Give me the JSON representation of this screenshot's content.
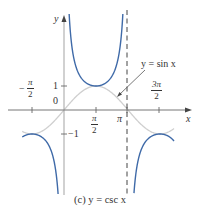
{
  "chart_data": {
    "type": "line",
    "title": "(c) y = csc x",
    "xlabel": "x",
    "ylabel": "y",
    "x_ticks": [
      {
        "value": -1.5708,
        "label": "-π/2"
      },
      {
        "value": 1.5708,
        "label": "π/2"
      },
      {
        "value": 3.1416,
        "label": "π"
      },
      {
        "value": 4.7124,
        "label": "3π/2"
      }
    ],
    "y_ticks": [
      {
        "value": 1,
        "label": "1"
      },
      {
        "value": 0,
        "label": "0"
      },
      {
        "value": -1,
        "label": "-1"
      }
    ],
    "xlim": [
      -2.0,
      5.9
    ],
    "ylim": [
      -3.6,
      4.2
    ],
    "grid": false,
    "series": [
      {
        "name": "y = csc x",
        "color": "#3f6aa8",
        "style": "solid",
        "domain": "x in (-2.0,0) ∪ (0,π) ∪ (π,5.4)",
        "key_points": [
          [
            -1.5708,
            -1
          ],
          [
            1.5708,
            1
          ],
          [
            4.7124,
            -1
          ]
        ]
      },
      {
        "name": "y = sin x",
        "color": "#c8c8c8",
        "style": "solid",
        "key_points": [
          [
            -1.5708,
            -1
          ],
          [
            0,
            0
          ],
          [
            1.5708,
            1
          ],
          [
            3.1416,
            0
          ],
          [
            4.7124,
            -1
          ]
        ]
      }
    ],
    "asymptotes": [
      {
        "x": 3.1416,
        "style": "dashed"
      }
    ],
    "annotations": [
      {
        "text": "y = sin x",
        "arrow_to": [
          2.6,
          0.5
        ]
      }
    ]
  },
  "labels": {
    "y_axis": "y",
    "x_axis": "x",
    "neg_pi_half": {
      "sign": "−",
      "num": "π",
      "den": "2"
    },
    "pi_half": {
      "num": "π",
      "den": "2"
    },
    "pi": "π",
    "three_pi_half": {
      "num": "3π",
      "den": "2"
    },
    "one": "1",
    "zero": "0",
    "neg_one": "−1",
    "sin_annotation": "y = sin x",
    "caption": "(c) y = csc x"
  },
  "colors": {
    "csc": "#3f6aa8",
    "sin": "#c8c8c8",
    "axis": "#555555",
    "asymptote": "#333333"
  }
}
